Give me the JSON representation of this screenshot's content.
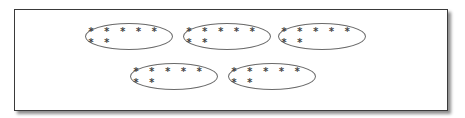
{
  "diagram": {
    "groups": [
      {
        "id": 1,
        "label": "* * * * * * *",
        "count": 7,
        "row": 1
      },
      {
        "id": 2,
        "label": "* * * * * * *",
        "count": 7,
        "row": 1
      },
      {
        "id": 3,
        "label": "* * * * * * *",
        "count": 7,
        "row": 1
      },
      {
        "id": 4,
        "label": "* * * * * * *",
        "count": 7,
        "row": 2
      },
      {
        "id": 5,
        "label": "* * * * * * *",
        "count": 7,
        "row": 2
      }
    ],
    "colors": {
      "border": "#3a3a3a",
      "oval": "#6a6a6a",
      "text": "#444444"
    }
  }
}
